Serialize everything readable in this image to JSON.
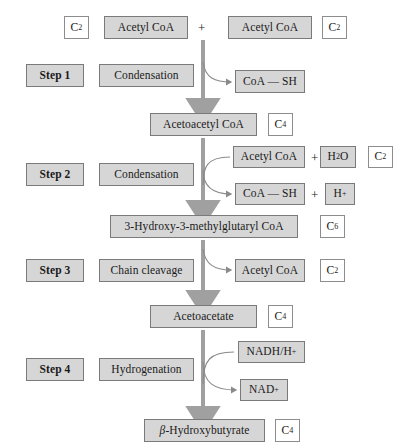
{
  "diagram": {
    "accent_grey": "#d6d6d6",
    "arrow_color": "#a0a0a0",
    "border_color": "#8d8d8d"
  },
  "row_substrates": {
    "left_carbon": "C2",
    "left_metabolite": "Acetyl CoA",
    "operator": "+",
    "right_metabolite": "Acetyl CoA",
    "right_carbon": "C2"
  },
  "steps": [
    {
      "number": "Step 1",
      "reaction": "Condensation",
      "outputs": [
        "CoA — SH"
      ],
      "inputs": []
    },
    {
      "number": "Step 2",
      "reaction": "Condensation",
      "inputs": [
        "Acetyl CoA"
      ],
      "input_extra": "H2O",
      "input_carbon": "C2",
      "outputs": [
        "CoA — SH"
      ],
      "output_extra": "H+"
    },
    {
      "number": "Step 3",
      "reaction": "Chain cleavage",
      "outputs": [
        "Acetyl CoA"
      ],
      "output_carbon": "C2"
    },
    {
      "number": "Step 4",
      "reaction": "Hydrogenation",
      "inputs": [
        "NADH/H+"
      ],
      "outputs": [
        "NAD+"
      ]
    }
  ],
  "intermediates": [
    {
      "name": "Acetoacetyl CoA",
      "carbon": "C4"
    },
    {
      "name": "3-Hydroxy-3-methylglutaryl CoA",
      "carbon": "C6"
    },
    {
      "name": "Acetoacetate",
      "carbon": "C4"
    },
    {
      "name": "β-Hydroxybutyrate",
      "carbon": "C4"
    }
  ],
  "labels": {
    "c2": "C",
    "c2_sub": "2",
    "c4": "C",
    "c4_sub": "4",
    "c6": "C",
    "c6_sub": "6",
    "h2o": "H",
    "h2o_sub": "2",
    "h2o_tail": "O",
    "h_plus": "H",
    "h_plus_sup": "+",
    "nadh": "NADH/H",
    "nadh_sup": "+",
    "nad": "NAD",
    "nad_sup": "+",
    "coash": "CoA — SH",
    "acetyl_coa": "Acetyl CoA",
    "beta": "β",
    "hydroxybutyrate": "-Hydroxybutyrate",
    "plus": "+"
  }
}
